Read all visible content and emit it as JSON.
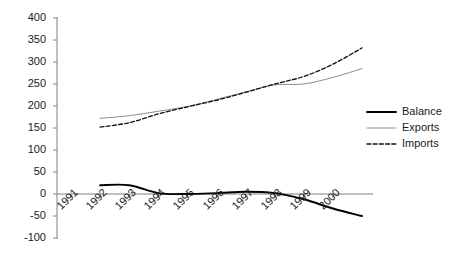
{
  "chart_data": {
    "type": "line",
    "title": "",
    "subtitle": "",
    "xlabel": "",
    "ylabel": "",
    "ylim": [
      -100,
      400
    ],
    "xlim": [
      1991,
      2000
    ],
    "grid": false,
    "legend_position": "right",
    "y_ticks": [
      400,
      350,
      300,
      250,
      200,
      150,
      100,
      50,
      0,
      -50,
      -100
    ],
    "y_tick_labels": [
      "400",
      "350",
      "300",
      "250",
      "200",
      "150",
      "100",
      "50",
      "0",
      "-50",
      "-100"
    ],
    "x_ticks": [
      1991,
      1992,
      1993,
      1994,
      1995,
      1996,
      1997,
      1998,
      1999,
      2000
    ],
    "x_tick_labels": [
      "1991",
      "1992",
      "1993",
      "1994",
      "1995",
      "1996",
      "1997",
      "1998",
      "1999",
      "2000"
    ],
    "categories": [
      1992,
      1993,
      1994,
      1995,
      1996,
      1997,
      1998,
      1999,
      2000,
      2001
    ],
    "series": [
      {
        "name": "Balance",
        "style": "solid-thick",
        "color": "#000000",
        "values": [
          20,
          20,
          2,
          0,
          2,
          5,
          2,
          -12,
          -33,
          -50
        ]
      },
      {
        "name": "Exports",
        "style": "solid-thin",
        "color": "#8c8c8c",
        "values": [
          172,
          178,
          188,
          199,
          215,
          232,
          248,
          250,
          265,
          285
        ]
      },
      {
        "name": "Imports",
        "style": "dashed",
        "color": "#111111",
        "values": [
          152,
          162,
          182,
          198,
          213,
          231,
          250,
          267,
          295,
          332
        ]
      }
    ]
  },
  "legend": {
    "items": [
      {
        "label": "Balance",
        "style": "solid-thick",
        "color": "#000000"
      },
      {
        "label": "Exports",
        "style": "solid-thin",
        "color": "#8c8c8c"
      },
      {
        "label": "Imports",
        "style": "dashed",
        "color": "#111111"
      }
    ]
  }
}
